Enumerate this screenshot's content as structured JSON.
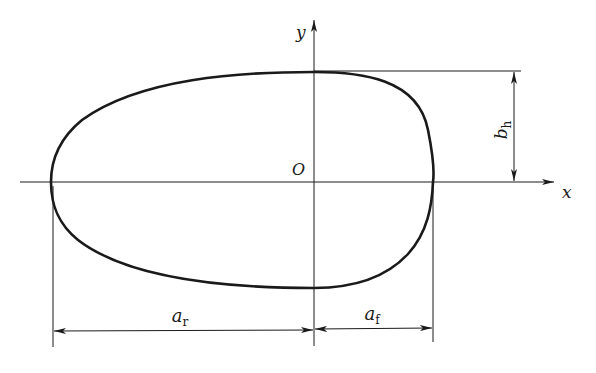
{
  "diagram": {
    "type": "egg-shaped cross-section with dimensions",
    "axes": {
      "x_label": "x",
      "y_label": "y",
      "origin_label": "O"
    },
    "dimensions": {
      "rear_semi_axis": {
        "base": "a",
        "sub": "r"
      },
      "front_semi_axis": {
        "base": "a",
        "sub": "f"
      },
      "half_height": {
        "base": "b",
        "sub": "h"
      }
    },
    "colors": {
      "stroke": "#1a1a1a",
      "background": "#ffffff"
    }
  }
}
